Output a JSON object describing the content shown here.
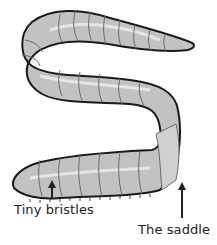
{
  "diagram": {
    "labels": [
      {
        "id": "bristles",
        "text": "Tiny bristles"
      },
      {
        "id": "saddle",
        "text": "The saddle"
      }
    ],
    "colors": {
      "body_fill": "#c2c2c2",
      "body_highlight": "#e6e6e6",
      "outline": "#1a1a1a",
      "segment_lines": "#6a6a6a",
      "arrow": "#222222"
    }
  }
}
